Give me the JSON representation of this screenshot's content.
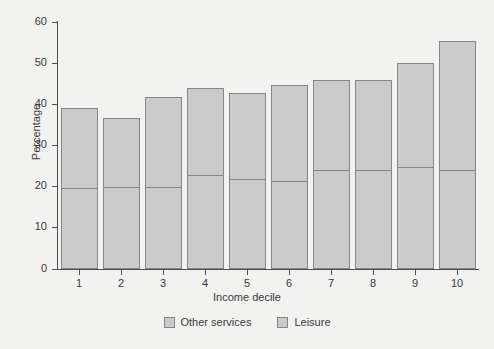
{
  "chart_data": {
    "type": "bar",
    "title": "",
    "subtitle": "",
    "xlabel": "Income decile",
    "ylabel": "Percentage",
    "categories": [
      "1",
      "2",
      "3",
      "4",
      "5",
      "6",
      "7",
      "8",
      "9",
      "10"
    ],
    "ylim": [
      0,
      60
    ],
    "yticks": [
      0,
      10,
      20,
      30,
      40,
      50,
      60
    ],
    "grid": false,
    "legend_position": "bottom",
    "stacked": true,
    "note": "Each bar is a stacked total; the horizontal rule inside each bar separates the lower 'Leisure' segment from the upper 'Other services' segment.",
    "series": [
      {
        "name": "Leisure",
        "color": "#cbcbcb",
        "values": [
          19.7,
          19.8,
          20.0,
          22.8,
          21.8,
          21.4,
          24.0,
          24.0,
          24.7,
          24.0
        ]
      },
      {
        "name": "Other services",
        "color": "#cbcbcb",
        "values": [
          19.3,
          16.9,
          21.8,
          21.1,
          20.9,
          23.2,
          21.8,
          21.8,
          25.3,
          31.3
        ]
      }
    ],
    "totals": [
      39.0,
      36.7,
      41.8,
      43.9,
      42.7,
      44.6,
      45.8,
      45.8,
      50.0,
      55.3
    ],
    "legend": [
      {
        "label": "Other services",
        "swatch": "legend-swatch-other-services"
      },
      {
        "label": "Leisure",
        "swatch": "legend-swatch-leisure"
      }
    ]
  },
  "colors": {
    "background": "#f2f2f0",
    "bar_fill": "#cbcbcb",
    "bar_border": "#878787",
    "axis": "#4d4d4d",
    "text": "#3a3a3a"
  }
}
